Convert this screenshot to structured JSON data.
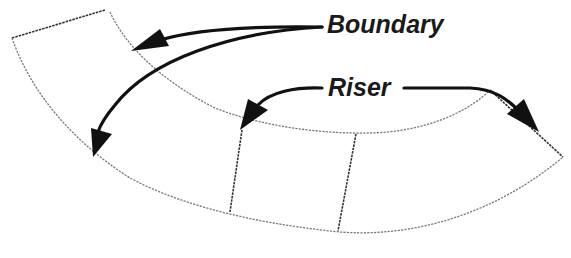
{
  "diagram": {
    "type": "curved stair plan",
    "labels": {
      "boundary": "Boundary",
      "riser": "Riser"
    },
    "colors": {
      "edge": "#7a7a7a",
      "riser_edge": "#333333",
      "arrow": "#111111",
      "text": "#1a1a1a",
      "background": "#ffffff"
    },
    "annotations": [
      {
        "label": "Boundary",
        "arrows": 2,
        "targets": [
          "inner-boundary-arc",
          "outer-boundary-arc"
        ]
      },
      {
        "label": "Riser",
        "arrows": 2,
        "targets": [
          "riser-left",
          "riser-end-right"
        ]
      }
    ]
  }
}
